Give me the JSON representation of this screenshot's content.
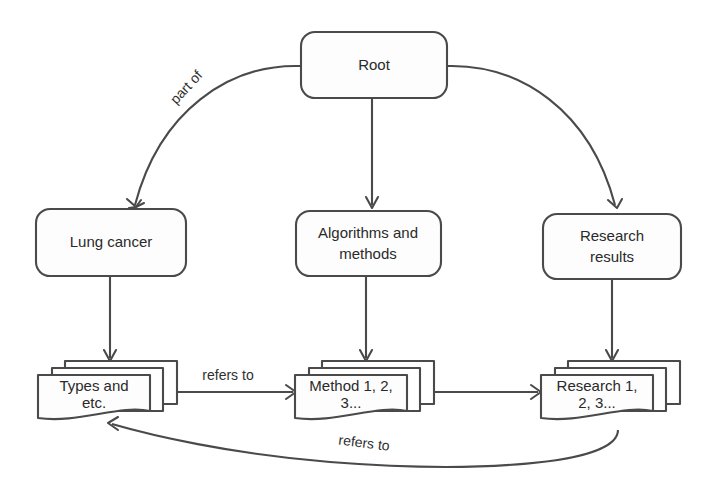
{
  "diagram": {
    "background_color": "#ffffff",
    "line_color": "#4a4a4a",
    "text_color": "#2a2a2a",
    "nodes": [
      {
        "id": "root",
        "label": "Root",
        "shape": "rounded-rectangle",
        "level": 0
      },
      {
        "id": "lung_cancer",
        "label": "Lung cancer",
        "shape": "rounded-rectangle",
        "level": 1
      },
      {
        "id": "algorithms",
        "label_line1": "Algorithms and",
        "label_line2": "methods",
        "shape": "rounded-rectangle",
        "level": 1
      },
      {
        "id": "research_results",
        "label_line1": "Research",
        "label_line2": "results",
        "shape": "rounded-rectangle",
        "level": 1
      },
      {
        "id": "types",
        "label_line1": "Types and",
        "label_line2": "etc.",
        "shape": "stacked-document",
        "level": 2
      },
      {
        "id": "methods",
        "label_line1": "Method 1, 2,",
        "label_line2": "3...",
        "shape": "stacked-document",
        "level": 2
      },
      {
        "id": "research",
        "label_line1": "Research 1,",
        "label_line2": "2, 3...",
        "shape": "stacked-document",
        "level": 2
      }
    ],
    "edges": [
      {
        "from": "root",
        "to": "lung_cancer",
        "label": "part of",
        "style": "curved",
        "arrow": "end"
      },
      {
        "from": "root",
        "to": "algorithms",
        "label": "",
        "style": "straight",
        "arrow": "end"
      },
      {
        "from": "root",
        "to": "research_results",
        "label": "",
        "style": "curved",
        "arrow": "end"
      },
      {
        "from": "lung_cancer",
        "to": "types",
        "label": "",
        "style": "straight",
        "arrow": "end"
      },
      {
        "from": "algorithms",
        "to": "methods",
        "label": "",
        "style": "straight",
        "arrow": "end"
      },
      {
        "from": "research_results",
        "to": "research",
        "label": "",
        "style": "straight",
        "arrow": "end"
      },
      {
        "from": "types",
        "to": "methods",
        "label": "refers to",
        "style": "straight",
        "arrow": "end"
      },
      {
        "from": "methods",
        "to": "research",
        "label": "",
        "style": "straight",
        "arrow": "end"
      },
      {
        "from": "research",
        "to": "types",
        "label": "refers to",
        "style": "curved",
        "arrow": "end"
      }
    ]
  }
}
